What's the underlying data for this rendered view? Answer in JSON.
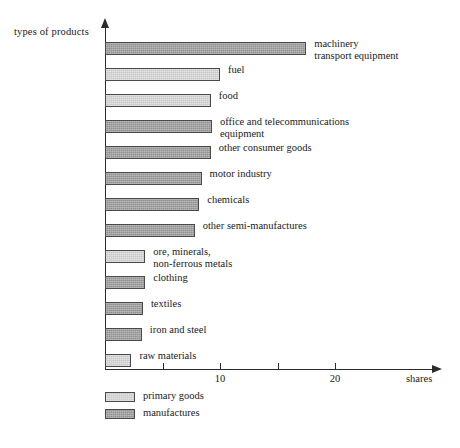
{
  "chart_data": {
    "type": "bar",
    "orientation": "horizontal",
    "title": "",
    "xlabel": "shares",
    "ylabel": "types of products",
    "xlim": [
      0,
      28.5
    ],
    "xticks": [
      5,
      10,
      15,
      20
    ],
    "xtick_labels": [
      "",
      "10",
      "",
      "20"
    ],
    "grid": false,
    "legend_position": "bottom-left",
    "categories": [
      "machinery\ntransport equipment",
      "fuel",
      "food",
      "office and telecommunications\nequipment",
      "other consumer goods",
      "motor industry",
      "chemicals",
      "other semi-manufactures",
      "ore, minerals,\nnon-ferrous metals",
      "clothing",
      "textiles",
      "iron and steel",
      "raw materials"
    ],
    "values": [
      17.5,
      10.0,
      9.2,
      9.3,
      9.2,
      8.4,
      8.2,
      7.8,
      3.5,
      3.5,
      3.3,
      3.2,
      2.3
    ],
    "groups": [
      "manufactures",
      "primary goods",
      "primary goods",
      "manufactures",
      "manufactures",
      "manufactures",
      "manufactures",
      "manufactures",
      "primary goods",
      "manufactures",
      "manufactures",
      "manufactures",
      "primary goods"
    ],
    "series": [
      {
        "name": "primary goods",
        "color": "#c9c9c9"
      },
      {
        "name": "manufactures",
        "color": "#919191"
      }
    ]
  },
  "axes": {
    "y_title": "types of products",
    "x_title": "shares"
  },
  "legend": {
    "items": [
      {
        "label": "primary goods",
        "swatch": "primary"
      },
      {
        "label": "manufactures",
        "swatch": "manufactures"
      }
    ]
  }
}
